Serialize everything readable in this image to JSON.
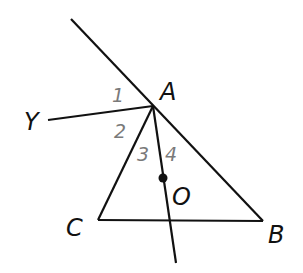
{
  "diagram": {
    "points": {
      "A": {
        "label": "A",
        "x": 153,
        "y": 106
      },
      "B": {
        "label": "B",
        "x": 263,
        "y": 221
      },
      "C": {
        "label": "C",
        "x": 98,
        "y": 220
      },
      "O": {
        "label": "O",
        "x": 163,
        "y": 178
      },
      "Y": {
        "label": "Y",
        "x": 48,
        "y": 120
      }
    },
    "angle_labels": [
      "1",
      "2",
      "3",
      "4"
    ],
    "colors": {
      "line": "#111111",
      "point_label": "#111111",
      "angle_label": "#7a7a7a"
    }
  }
}
